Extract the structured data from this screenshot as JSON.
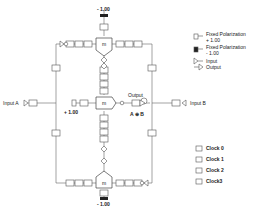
{
  "diagram": {
    "gates": [
      {
        "id": "top",
        "label": "m"
      },
      {
        "id": "middle",
        "label": "m"
      },
      {
        "id": "bottom",
        "label": "m"
      }
    ],
    "fixed_top": "- 1.00",
    "fixed_middle": "+ 1.00",
    "fixed_bottom": "- 1.00",
    "input_a": "Input A",
    "input_b": "Input B",
    "output": "Output",
    "output_expr": "A ⊕ B",
    "clock_glyphs": [
      "Γ0",
      "Γ1",
      "Γ2",
      "Γ3"
    ]
  },
  "legend": {
    "items": [
      {
        "icon": "fixed-pos-icon",
        "label1": "Fixed Polarization",
        "label2": "+ 1.00"
      },
      {
        "icon": "fixed-neg-icon",
        "label1": "Fixed Polarization",
        "label2": "- 1.00"
      },
      {
        "icon": "input-icon",
        "label1": "Input"
      },
      {
        "icon": "output-icon",
        "label1": "Output"
      }
    ],
    "clocks": [
      {
        "glyph": "Γ0",
        "label": "Clock 0"
      },
      {
        "glyph": "Γ1",
        "label": "Clock 1"
      },
      {
        "glyph": "Γ2",
        "label": "Clock 2"
      },
      {
        "glyph": "Γ3",
        "label": "Clock3"
      }
    ]
  }
}
